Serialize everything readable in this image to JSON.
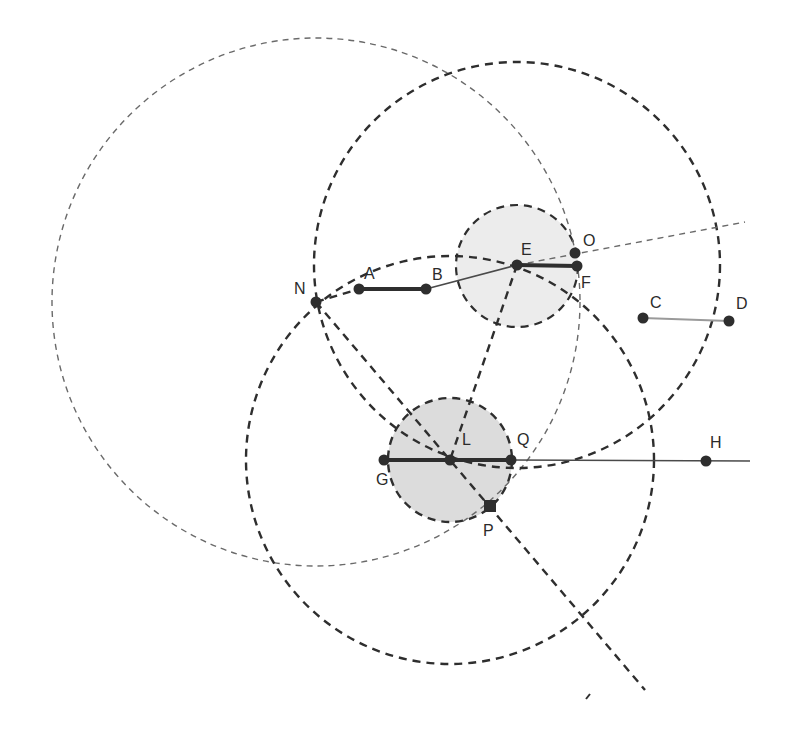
{
  "diagram": {
    "type": "geometric-construction",
    "colors": {
      "ink": "#2e2e2e",
      "thin_ink": "#6a6a6a",
      "fill_L": "#dcdcdc",
      "fill_E": "#ececec",
      "segment_CD": "#9a9a9a"
    },
    "points": [
      {
        "id": "N",
        "label": "N",
        "x": 316,
        "y": 302,
        "lx": 294,
        "ly": 294
      },
      {
        "id": "A",
        "label": "A",
        "x": 359,
        "y": 289,
        "lx": 364,
        "ly": 279
      },
      {
        "id": "B",
        "label": "B",
        "x": 426,
        "y": 289,
        "lx": 432,
        "ly": 280
      },
      {
        "id": "E",
        "label": "E",
        "x": 517,
        "y": 265,
        "lx": 521,
        "ly": 255
      },
      {
        "id": "O",
        "label": "O",
        "x": 575,
        "y": 253,
        "lx": 583,
        "ly": 246
      },
      {
        "id": "F",
        "label": "F",
        "x": 577,
        "y": 266,
        "lx": 581,
        "ly": 288
      },
      {
        "id": "C",
        "label": "C",
        "x": 643,
        "y": 318,
        "lx": 650,
        "ly": 308
      },
      {
        "id": "D",
        "label": "D",
        "x": 729,
        "y": 321,
        "lx": 736,
        "ly": 309
      },
      {
        "id": "G",
        "label": "G",
        "x": 384,
        "y": 460,
        "lx": 376,
        "ly": 485
      },
      {
        "id": "L",
        "label": "L",
        "x": 450,
        "y": 460,
        "lx": 462,
        "ly": 445
      },
      {
        "id": "Q",
        "label": "Q",
        "x": 511,
        "y": 460,
        "lx": 517,
        "ly": 445
      },
      {
        "id": "H",
        "label": "H",
        "x": 706,
        "y": 461,
        "lx": 710,
        "ly": 448
      },
      {
        "id": "P",
        "label": "P",
        "x": 490,
        "y": 506,
        "lx": 483,
        "ly": 536
      }
    ],
    "circles": [
      {
        "id": "circle-N-large",
        "cx": 316,
        "cy": 302,
        "r": 264,
        "style": "thin-dashed"
      },
      {
        "id": "circle-E-large",
        "cx": 517,
        "cy": 265,
        "r": 203,
        "style": "dashed"
      },
      {
        "id": "circle-L-large",
        "cx": 450,
        "cy": 460,
        "r": 204,
        "style": "dashed"
      },
      {
        "id": "disk-E",
        "cx": 517,
        "cy": 266,
        "r": 61,
        "style": "dashed-filled-light"
      },
      {
        "id": "disk-L",
        "cx": 450,
        "cy": 460,
        "r": 62,
        "style": "dashed-filled"
      }
    ],
    "segments": [
      {
        "id": "seg-AB",
        "from": "A",
        "to": "B",
        "style": "thick"
      },
      {
        "id": "seg-EF",
        "from": "E",
        "to": "F",
        "style": "thick"
      },
      {
        "id": "seg-GQ",
        "from": "G",
        "to": "Q",
        "style": "thick"
      },
      {
        "id": "seg-CD",
        "from": "C",
        "to": "D",
        "style": "gray"
      },
      {
        "id": "seg-BE",
        "from": "B",
        "to": "E",
        "style": "thin-solid"
      }
    ],
    "lines": [
      {
        "id": "ray-E-O",
        "x1": 517,
        "y1": 265,
        "x2": 745,
        "y2": 222,
        "style": "thin-dashed"
      },
      {
        "id": "ray-Q-H",
        "x1": 511,
        "y1": 460,
        "x2": 750,
        "y2": 461,
        "style": "thin-solid"
      },
      {
        "id": "line-N-P",
        "x1": 316,
        "y1": 302,
        "x2": 645,
        "y2": 690,
        "style": "dashed"
      },
      {
        "id": "line-E-L",
        "x1": 517,
        "y1": 265,
        "x2": 450,
        "y2": 460,
        "style": "dashed"
      },
      {
        "id": "line-N-A",
        "x1": 316,
        "y1": 302,
        "x2": 359,
        "y2": 289,
        "style": "dashed"
      }
    ],
    "stray_mark": {
      "x1": 586,
      "y1": 699,
      "x2": 590,
      "y2": 694
    }
  }
}
